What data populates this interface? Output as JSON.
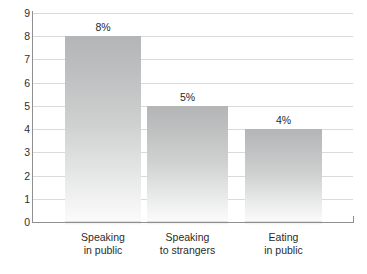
{
  "chart_data": {
    "type": "bar",
    "title": "",
    "subtitle": "",
    "xlabel": "",
    "ylabel": "",
    "categories": [
      "Speaking in public",
      "Speaking to strangers",
      "Eating in public"
    ],
    "category_lines": [
      [
        "Speaking",
        "in public"
      ],
      [
        "Speaking",
        "to strangers"
      ],
      [
        "Eating",
        "in public"
      ]
    ],
    "values": [
      8,
      5,
      4
    ],
    "value_labels": [
      "8%",
      "5%",
      "4%"
    ],
    "ylim": [
      0,
      9
    ],
    "yticks": [
      9,
      8,
      7,
      6,
      5,
      4,
      3,
      2,
      1,
      0
    ],
    "ytick_labels": [
      "9",
      "8",
      "7",
      "6",
      "5",
      "4",
      "3",
      "2",
      "1",
      "0"
    ],
    "grid": true,
    "grid_axis": "y",
    "legend": false,
    "legend_position": "none",
    "colors": {
      "bar_top": "#b4b5b6",
      "bar_bottom": "#fbfbfb",
      "gridline": "#d8dadc",
      "axis": "#8d8f91",
      "text": "#2b2b2b",
      "background": "#ffffff"
    }
  }
}
